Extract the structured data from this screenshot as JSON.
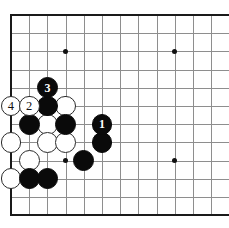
{
  "figure": {
    "kind": "go-board-diagram",
    "board_size_columns": 13,
    "board_size_rows": 12,
    "colors": {
      "background": "#ffffff",
      "grid_line": "#8e8e8e",
      "border_line": "#1a1a1a",
      "black_stone": "#0a0a0a",
      "white_stone": "#ffffff",
      "white_stone_outline": "#2a2a2a",
      "star_point": "#111111",
      "black_label_text": "#ffffff",
      "white_label_text": "#111111"
    }
  },
  "board": {
    "origin_x": 11,
    "origin_y": 15,
    "spacing_x": 18.2,
    "spacing_y": 18.2,
    "columns": 12,
    "rows": 11,
    "left_edge_thick": true,
    "top_edge_thick": true,
    "bottom_edge_thick": true,
    "right_edge_visible": false
  },
  "star_points": [
    {
      "name": "star-top-left",
      "col": 3,
      "row": 2
    },
    {
      "name": "star-top-right",
      "col": 9,
      "row": 2
    },
    {
      "name": "star-bottom-left",
      "col": 3,
      "row": 8
    },
    {
      "name": "star-bottom-right",
      "col": 9,
      "row": 8
    }
  ],
  "stones": [
    {
      "name": "white-stone-move-4",
      "color": "white",
      "col": 0,
      "row": 5,
      "label": "4"
    },
    {
      "name": "white-stone-move-2",
      "color": "white",
      "col": 1,
      "row": 5,
      "label": "2"
    },
    {
      "name": "black-stone-move-3",
      "color": "black",
      "col": 2,
      "row": 4,
      "label": "3"
    },
    {
      "name": "black-stone-move-1",
      "color": "black",
      "col": 5,
      "row": 6,
      "label": "1"
    },
    {
      "name": "black-stone",
      "color": "black",
      "col": 2,
      "row": 5,
      "label": ""
    },
    {
      "name": "white-stone",
      "color": "white",
      "col": 3,
      "row": 5,
      "label": ""
    },
    {
      "name": "black-stone",
      "color": "black",
      "col": 1,
      "row": 6,
      "label": ""
    },
    {
      "name": "white-stone",
      "color": "white",
      "col": 2,
      "row": 6,
      "label": ""
    },
    {
      "name": "black-stone",
      "color": "black",
      "col": 3,
      "row": 6,
      "label": ""
    },
    {
      "name": "white-stone",
      "color": "white",
      "col": 0,
      "row": 7,
      "label": ""
    },
    {
      "name": "white-stone",
      "color": "white",
      "col": 2,
      "row": 7,
      "label": ""
    },
    {
      "name": "white-stone",
      "color": "white",
      "col": 3,
      "row": 7,
      "label": ""
    },
    {
      "name": "black-stone",
      "color": "black",
      "col": 5,
      "row": 7,
      "label": ""
    },
    {
      "name": "white-stone",
      "color": "white",
      "col": 1,
      "row": 8,
      "label": ""
    },
    {
      "name": "black-stone",
      "color": "black",
      "col": 4,
      "row": 8,
      "label": ""
    },
    {
      "name": "white-stone",
      "color": "white",
      "col": 0,
      "row": 9,
      "label": ""
    },
    {
      "name": "black-stone",
      "color": "black",
      "col": 1,
      "row": 9,
      "label": ""
    },
    {
      "name": "black-stone",
      "color": "black",
      "col": 2,
      "row": 9,
      "label": ""
    }
  ]
}
